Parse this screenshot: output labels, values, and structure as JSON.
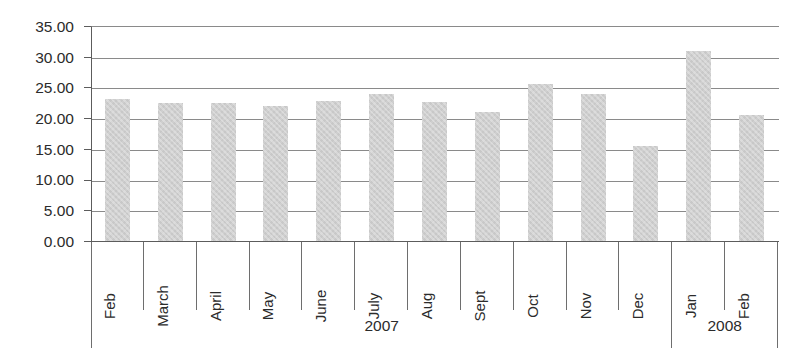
{
  "chart_data": {
    "type": "bar",
    "title": "",
    "subtitle": "",
    "xlabel": "",
    "ylabel": "",
    "categories": [
      "Feb",
      "March",
      "April",
      "May",
      "June",
      "July",
      "Aug",
      "Sept",
      "Oct",
      "Nov",
      "Dec",
      "Jan",
      "Feb"
    ],
    "values": [
      23.1,
      22.4,
      22.4,
      21.9,
      22.8,
      23.9,
      22.7,
      21.0,
      25.6,
      24.0,
      15.4,
      31.0,
      20.5
    ],
    "series": [
      {
        "name": "",
        "values": [
          23.1,
          22.4,
          22.4,
          21.9,
          22.8,
          23.9,
          22.7,
          21.0,
          25.6,
          24.0,
          15.4,
          31.0,
          20.5
        ]
      }
    ],
    "groups": [
      {
        "label": "2007",
        "span": 11
      },
      {
        "label": "2008",
        "span": 2
      }
    ],
    "ylim": [
      0,
      35
    ],
    "ytick_step": 5,
    "ytick_labels": [
      "35.00",
      "30.00",
      "25.00",
      "20.00",
      "15.00",
      "10.00",
      "5.00",
      "0.00"
    ],
    "ytick_values": [
      35,
      30,
      25,
      20,
      15,
      10,
      5,
      0
    ],
    "grid": true,
    "grid_axis": "y",
    "legend": false,
    "legend_position": "none",
    "bar_color": "#cfcfcf",
    "axis_color": "#5c5c5c",
    "grid_color": "#8a8a8a",
    "text_color": "#2b2b2b",
    "background_color": "#ffffff",
    "category_label_rotation": -90
  }
}
